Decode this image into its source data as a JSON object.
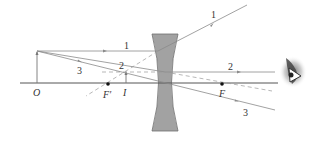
{
  "labels": {
    "object": "O",
    "image": "I",
    "focal_near": "F′",
    "focal_far": "F",
    "ray1": "1",
    "ray2": "2",
    "ray3": "3"
  },
  "elements": {
    "lens": "concave-lens",
    "eye": "observer-eye-icon"
  },
  "colors": {
    "ray": "#8a8a8a",
    "axis": "#555555",
    "lens_fill": "#9e9e9e",
    "lens_stroke": "#6f6f6f",
    "text": "#333333",
    "focal_point": "#111111"
  }
}
